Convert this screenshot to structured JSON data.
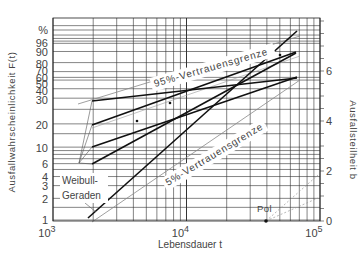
{
  "chart_data": {
    "type": "line",
    "title": "",
    "subtitle": "Weibull-Wahrscheinlichkeitsnetz",
    "xlabel": "Lebensdauer t",
    "ylabel": "Ausfallwahrscheinlichkeit F(t)",
    "y2label": "Ausfallsteilheit b",
    "x_scale": "log",
    "xlim": [
      1000,
      100000
    ],
    "x_ticks": [
      {
        "label_base": "10",
        "label_exp": "3",
        "value": 1000
      },
      {
        "label_base": "10",
        "label_exp": "4",
        "value": 10000
      },
      {
        "label_base": "10",
        "label_exp": "5",
        "value": 100000
      }
    ],
    "y_scale": "weibull",
    "y_unit": "%",
    "y_ticks": [
      {
        "label": "%",
        "py": 30
      },
      {
        "label": "96",
        "py": 43
      },
      {
        "label": "90",
        "py": 52
      },
      {
        "label": "80",
        "py": 64
      },
      {
        "label": "70",
        "py": 71
      },
      {
        "label": "60",
        "py": 78
      },
      {
        "label": "50",
        "py": 84
      },
      {
        "label": "40",
        "py": 91
      },
      {
        "label": "30",
        "py": 100
      },
      {
        "label": "20",
        "py": 125
      },
      {
        "label": "10",
        "py": 148
      },
      {
        "label": "6",
        "py": 164
      },
      {
        "label": "4",
        "py": 177
      },
      {
        "label": "3",
        "py": 186
      },
      {
        "label": "2",
        "py": 199
      },
      {
        "label": "1",
        "py": 220
      }
    ],
    "y2_ticks": [
      {
        "label": "0",
        "value": 0
      },
      {
        "label": "2",
        "value": 2
      },
      {
        "label": "4",
        "value": 4
      },
      {
        "label": "6",
        "value": 6
      }
    ],
    "y2lim": [
      0,
      8.1
    ],
    "grid": true,
    "series": [
      {
        "name": "Weibull-Gerade 1",
        "points": [
          [
            2000,
            38
          ],
          [
            70000,
            62
          ]
        ]
      },
      {
        "name": "Weibull-Gerade 2",
        "points": [
          [
            2000,
            20
          ],
          [
            70000,
            88
          ]
        ]
      },
      {
        "name": "Weibull-Gerade 3",
        "points": [
          [
            2000,
            11
          ],
          [
            70000,
            62
          ]
        ]
      },
      {
        "name": "Weibull-Gerade 4",
        "points": [
          [
            2000,
            6
          ],
          [
            70000,
            88
          ]
        ]
      },
      {
        "name": "Weibull-Gerade (steil)",
        "points": [
          [
            1800,
            1
          ],
          [
            70000,
            98
          ]
        ]
      }
    ],
    "confidence_bounds": [
      {
        "name": "95%-Vertrauensgrenze"
      },
      {
        "name": "5%-Vertrauensgrenze"
      }
    ],
    "annotations": [
      {
        "text": "95%-Vertrauensgrenze",
        "rotation": -16
      },
      {
        "text": "5%-Vertrauensgrenze",
        "rotation": -30
      },
      {
        "text": "Weibull-",
        "line2": "Geraden"
      },
      {
        "text": "Pol",
        "t": 50000,
        "b": 0
      }
    ],
    "data_points": [
      {
        "t": 2000,
        "F": 8
      },
      {
        "t": 4500,
        "F": 22
      },
      {
        "t": 8000,
        "F": 35
      },
      {
        "t": 55000,
        "F": 75
      }
    ]
  },
  "labels": {
    "percent": "%",
    "xlabel": "Lebensdauer t",
    "ylabel": "Ausfallwahrscheinlichkeit F(t)",
    "y2label": "Ausfallsteilheit b",
    "ci95": "95%-Vertrauensgrenze",
    "ci5": "5%-Vertrauensgrenze",
    "weibull1": "Weibull-",
    "weibull2": "Geraden",
    "pol": "Pol"
  }
}
